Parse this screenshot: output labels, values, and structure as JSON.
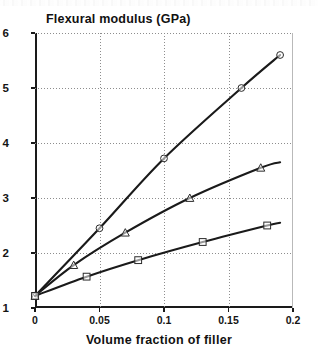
{
  "chart_data": {
    "type": "line",
    "title": "",
    "ylabel": "Flexural modulus (GPa)",
    "xlabel": "Volume fraction of filler",
    "xlim": [
      0,
      0.2
    ],
    "ylim": [
      1,
      6
    ],
    "xticks": [
      0,
      0.05,
      0.1,
      0.15,
      0.2
    ],
    "xticklabels": [
      "0",
      "0.05",
      "0.1",
      "0.15",
      "0.2"
    ],
    "yticks": [
      1,
      2,
      3,
      4,
      5,
      6
    ],
    "yticklabels": [
      "1",
      "2",
      "3",
      "4",
      "5",
      "6"
    ],
    "grid": true,
    "legend": "none",
    "series": [
      {
        "name": "upper-curve-circles",
        "marker": "circle",
        "color": "#1a1a1a",
        "x": [
          0,
          0.05,
          0.1,
          0.16,
          0.19
        ],
        "y": [
          1.22,
          2.45,
          3.72,
          5.0,
          5.6
        ]
      },
      {
        "name": "middle-curve-triangles",
        "marker": "triangle",
        "color": "#1a1a1a",
        "x": [
          0,
          0.03,
          0.07,
          0.12,
          0.175,
          0.19
        ],
        "y": [
          1.22,
          1.78,
          2.37,
          3.0,
          3.55,
          3.65
        ]
      },
      {
        "name": "lower-curve-squares",
        "marker": "square",
        "color": "#1a1a1a",
        "x": [
          0,
          0.04,
          0.08,
          0.13,
          0.18,
          0.19
        ],
        "y": [
          1.22,
          1.57,
          1.87,
          2.2,
          2.5,
          2.55
        ]
      }
    ]
  }
}
